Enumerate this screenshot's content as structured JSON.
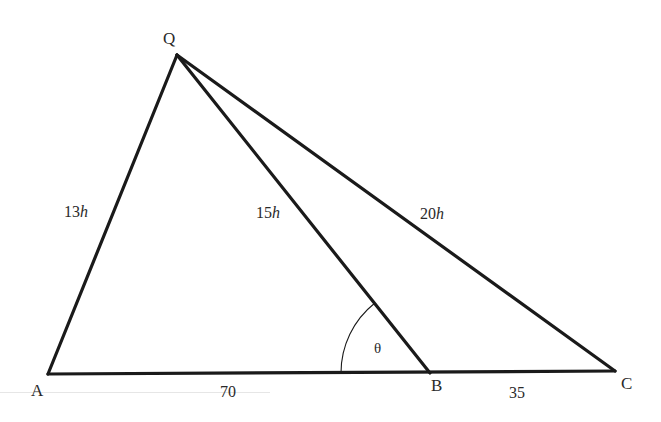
{
  "figure": {
    "type": "triangle-geometry",
    "vertices": {
      "Q": {
        "label": "Q",
        "x": 177,
        "y": 55
      },
      "A": {
        "label": "A",
        "x": 48,
        "y": 374
      },
      "B": {
        "label": "B",
        "x": 430,
        "y": 373
      },
      "C": {
        "label": "C",
        "x": 615,
        "y": 371
      }
    },
    "segments": [
      {
        "from": "Q",
        "to": "A",
        "length_label": "13",
        "unit": "h"
      },
      {
        "from": "Q",
        "to": "B",
        "length_label": "15",
        "unit": "h"
      },
      {
        "from": "Q",
        "to": "C",
        "length_label": "20",
        "unit": "h"
      },
      {
        "from": "A",
        "to": "B",
        "length_label": "70"
      },
      {
        "from": "B",
        "to": "C",
        "length_label": "35"
      }
    ],
    "angle": {
      "vertex": "B",
      "label": "θ",
      "between": [
        "B-A",
        "B-Q"
      ]
    },
    "line_color": "#1a1a1a",
    "text_color": "#2a2a2a"
  }
}
